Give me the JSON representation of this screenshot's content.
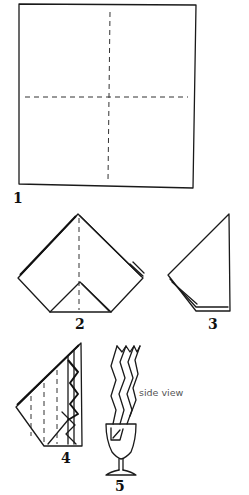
{
  "diagram": {
    "type": "napkin-folding-instructions",
    "steps": [
      {
        "number": "1",
        "description": "square napkin with center fold lines"
      },
      {
        "number": "2",
        "description": "folded into point with bottom corner folded up"
      },
      {
        "number": "3",
        "description": "folded in half"
      },
      {
        "number": "4",
        "description": "accordion pleats marked"
      },
      {
        "number": "5",
        "description": "pleated napkin placed in stemmed glass"
      }
    ],
    "annotations": {
      "side_view": "side view"
    }
  }
}
